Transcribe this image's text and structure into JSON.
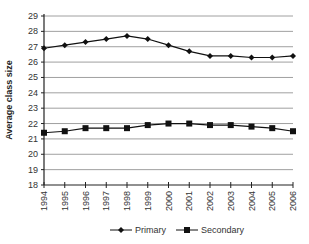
{
  "chart_data": {
    "type": "line",
    "title": "",
    "xlabel": "",
    "ylabel": "Average class size",
    "ylim": [
      18,
      29
    ],
    "yticks": [
      18,
      19,
      20,
      21,
      22,
      23,
      24,
      25,
      26,
      27,
      28,
      29
    ],
    "grid": true,
    "legend_position": "bottom",
    "categories": [
      "1994",
      "1995",
      "1996",
      "1997",
      "1998",
      "1999",
      "2000",
      "2001",
      "2002",
      "2003",
      "2004",
      "2005",
      "2006"
    ],
    "series": [
      {
        "name": "Primary",
        "marker": "diamond",
        "values": [
          26.9,
          27.1,
          27.3,
          27.5,
          27.7,
          27.5,
          27.1,
          26.7,
          26.4,
          26.4,
          26.3,
          26.3,
          26.4
        ]
      },
      {
        "name": "Secondary",
        "marker": "square",
        "values": [
          21.4,
          21.5,
          21.7,
          21.7,
          21.7,
          21.9,
          22.0,
          22.0,
          21.9,
          21.9,
          21.8,
          21.7,
          21.5
        ]
      }
    ]
  },
  "colors": {
    "line": "#111111",
    "grid": "#888888"
  }
}
